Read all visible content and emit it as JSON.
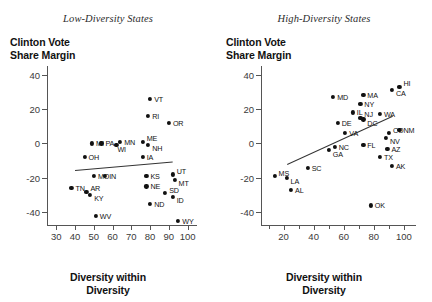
{
  "figure": {
    "panels": [
      {
        "id": "low-diversity",
        "title": "Low-Diversity States",
        "y_axis_title_line1": "Clinton Vote",
        "y_axis_title_line2": "Share Margin",
        "x_axis_title_line1": "Diversity within",
        "x_axis_title_line2": "Diversity"
      },
      {
        "id": "high-diversity",
        "title": "High-Diversity States",
        "y_axis_title_line1": "Clinton Vote",
        "y_axis_title_line2": "Share Margin",
        "x_axis_title_line1": "Diversity within",
        "x_axis_title_line2": "Diversity"
      }
    ]
  },
  "chart_data": [
    {
      "type": "scatter",
      "title": "Low-Diversity States",
      "xlabel": "Diversity within Diversity",
      "ylabel": "Clinton Vote Share Margin",
      "xlim": [
        25,
        105
      ],
      "ylim": [
        -48,
        45
      ],
      "xticks": [
        30,
        40,
        50,
        60,
        70,
        80,
        90,
        100
      ],
      "yticks": [
        40,
        20,
        0,
        -20,
        -40
      ],
      "grid": false,
      "legend": "none",
      "trendline": {
        "x1": 40,
        "y1": -15.5,
        "x2": 92,
        "y2": -10.5
      },
      "points": [
        {
          "label": "VT",
          "x": 80,
          "y": 26
        },
        {
          "label": "RI",
          "x": 79,
          "y": 16
        },
        {
          "label": "OR",
          "x": 90,
          "y": 12
        },
        {
          "label": "MI",
          "x": 49,
          "y": 0
        },
        {
          "label": "PA",
          "x": 54,
          "y": 0
        },
        {
          "label": "WI",
          "x": 62,
          "y": -1
        },
        {
          "label": "MN",
          "x": 64,
          "y": 1
        },
        {
          "label": "ME",
          "x": 76,
          "y": 1
        },
        {
          "label": "NH",
          "x": 79,
          "y": -1
        },
        {
          "label": "OH",
          "x": 45,
          "y": -8
        },
        {
          "label": "IA",
          "x": 76,
          "y": -8
        },
        {
          "label": "MO",
          "x": 50,
          "y": -19
        },
        {
          "label": "IN",
          "x": 56,
          "y": -19
        },
        {
          "label": "KS",
          "x": 78,
          "y": -19
        },
        {
          "label": "UT",
          "x": 92,
          "y": -18
        },
        {
          "label": "MT",
          "x": 93,
          "y": -21
        },
        {
          "label": "TN",
          "x": 38,
          "y": -26
        },
        {
          "label": "AR",
          "x": 46,
          "y": -28
        },
        {
          "label": "KY",
          "x": 48,
          "y": -30
        },
        {
          "label": "NE",
          "x": 78,
          "y": -25
        },
        {
          "label": "SD",
          "x": 88,
          "y": -29
        },
        {
          "label": "ID",
          "x": 92,
          "y": -31
        },
        {
          "label": "ND",
          "x": 80,
          "y": -35
        },
        {
          "label": "WV",
          "x": 51,
          "y": -42
        },
        {
          "label": "WY",
          "x": 95,
          "y": -45
        }
      ]
    },
    {
      "type": "scatter",
      "title": "High-Diversity States",
      "xlabel": "Diversity within Diversity",
      "ylabel": "Clinton Vote Share Margin",
      "xlim": [
        5,
        108
      ],
      "ylim": [
        -48,
        45
      ],
      "xticks": [
        20,
        40,
        60,
        80,
        100
      ],
      "yticks": [
        40,
        20,
        0,
        -20,
        -40
      ],
      "grid": false,
      "legend": "none",
      "trendline": {
        "x1": 22,
        "y1": -12,
        "x2": 92,
        "y2": 16
      },
      "points": [
        {
          "label": "HI",
          "x": 97,
          "y": 33
        },
        {
          "label": "CA",
          "x": 92,
          "y": 31
        },
        {
          "label": "MA",
          "x": 73,
          "y": 28
        },
        {
          "label": "MD",
          "x": 53,
          "y": 27
        },
        {
          "label": "NY",
          "x": 71,
          "y": 23
        },
        {
          "label": "IL",
          "x": 66,
          "y": 18
        },
        {
          "label": "NJ",
          "x": 71,
          "y": 15
        },
        {
          "label": "DC",
          "x": 73,
          "y": 14
        },
        {
          "label": "WA",
          "x": 84,
          "y": 17
        },
        {
          "label": "DE",
          "x": 56,
          "y": 12
        },
        {
          "label": "NM",
          "x": 97,
          "y": 8
        },
        {
          "label": "CO",
          "x": 90,
          "y": 6
        },
        {
          "label": "VA",
          "x": 61,
          "y": 6
        },
        {
          "label": "NV",
          "x": 88,
          "y": 3
        },
        {
          "label": "GA",
          "x": 50,
          "y": -4
        },
        {
          "label": "NC",
          "x": 54,
          "y": -2
        },
        {
          "label": "FL",
          "x": 73,
          "y": -1
        },
        {
          "label": "AZ",
          "x": 89,
          "y": -3
        },
        {
          "label": "TX",
          "x": 84,
          "y": -8
        },
        {
          "label": "AK",
          "x": 92,
          "y": -13
        },
        {
          "label": "SC",
          "x": 36,
          "y": -14
        },
        {
          "label": "MS",
          "x": 14,
          "y": -19
        },
        {
          "label": "LA",
          "x": 22,
          "y": -20
        },
        {
          "label": "AL",
          "x": 25,
          "y": -27
        },
        {
          "label": "OK",
          "x": 78,
          "y": -36
        }
      ]
    }
  ]
}
